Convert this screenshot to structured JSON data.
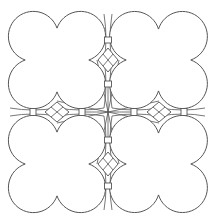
{
  "diagram": {
    "type": "geometric-tiling-pattern",
    "canvas": {
      "width": 215,
      "height": 224,
      "background": "#ffffff"
    },
    "stroke_color": "#555555",
    "quatrefoils": [
      {
        "id": "top-left",
        "lobe_radius": 25,
        "lobes": [
          [
            35,
            37
          ],
          [
            79,
            37
          ],
          [
            35,
            83
          ],
          [
            79,
            83
          ]
        ]
      },
      {
        "id": "top-right",
        "lobe_radius": 25,
        "lobes": [
          [
            136,
            37
          ],
          [
            181,
            37
          ],
          [
            136,
            83
          ],
          [
            181,
            83
          ]
        ]
      },
      {
        "id": "bottom-left",
        "lobe_radius": 25,
        "lobes": [
          [
            35,
            141
          ],
          [
            79,
            141
          ],
          [
            35,
            187
          ],
          [
            79,
            187
          ]
        ]
      },
      {
        "id": "bottom-right",
        "lobe_radius": 25,
        "lobes": [
          [
            136,
            141
          ],
          [
            181,
            141
          ],
          [
            136,
            187
          ],
          [
            181,
            187
          ]
        ]
      }
    ],
    "diamonds": [
      {
        "id": "top-gap",
        "cx": 108,
        "cy": 60,
        "rx": 10,
        "ry": 12
      },
      {
        "id": "bottom-gap",
        "cx": 108,
        "cy": 164,
        "rx": 10,
        "ry": 12
      },
      {
        "id": "left-gap",
        "cx": 57,
        "cy": 112,
        "rx": 12,
        "ry": 10
      },
      {
        "id": "right-gap",
        "cx": 159,
        "cy": 112,
        "rx": 12,
        "ry": 10
      }
    ],
    "connectors": [
      {
        "cx": 108,
        "cy": 40,
        "orient": "v"
      },
      {
        "cx": 108,
        "cy": 84,
        "orient": "v"
      },
      {
        "cx": 108,
        "cy": 140,
        "orient": "v"
      },
      {
        "cx": 108,
        "cy": 186,
        "orient": "v"
      },
      {
        "cx": 33,
        "cy": 112,
        "orient": "h"
      },
      {
        "cx": 82,
        "cy": 112,
        "orient": "h"
      },
      {
        "cx": 134,
        "cy": 112,
        "orient": "h"
      },
      {
        "cx": 184,
        "cy": 112,
        "orient": "h"
      }
    ],
    "center": {
      "cx": 108,
      "cy": 112
    }
  }
}
